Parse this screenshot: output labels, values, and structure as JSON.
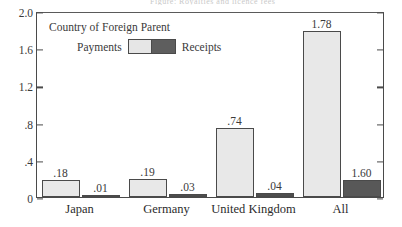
{
  "figure": {
    "ghost_text": "Figure: Royalties and licence fees",
    "plot_title": "Country of Foreign Parent",
    "legend": {
      "left_label": "Payments",
      "right_label": "Receipts",
      "swatch_name": "payments-receipts-swatch"
    }
  },
  "chart_data": {
    "type": "bar",
    "title": "Country of Foreign Parent",
    "xlabel": "",
    "ylabel": "",
    "ylim": [
      0,
      2.0
    ],
    "grid": false,
    "legend_position": "inside-top-left",
    "categories": [
      "Japan",
      "Germany",
      "United Kingdom",
      "All"
    ],
    "series": [
      {
        "name": "Payments",
        "color": "#e8e8e8",
        "values": [
          0.18,
          0.19,
          0.74,
          1.78
        ],
        "labels": [
          ".18",
          ".19",
          ".74",
          "1.78"
        ]
      },
      {
        "name": "Receipts",
        "color": "#585858",
        "values": [
          0.01,
          0.03,
          0.04,
          1.6
        ],
        "labels": [
          ".01",
          ".03",
          ".04",
          "1.60"
        ],
        "drawn_heights": [
          0.01,
          0.03,
          0.04,
          0.18
        ],
        "note": "All/Receipts bar is drawn at ~0.18 height in the original figure although labeled 1.60"
      }
    ],
    "yticks": [
      {
        "value": 2.0,
        "label": "2.0"
      },
      {
        "value": 1.6,
        "label": "1.6"
      },
      {
        "value": 1.2,
        "label": "1.2"
      },
      {
        "value": 0.8,
        "label": ".8"
      },
      {
        "value": 0.4,
        "label": ".4"
      },
      {
        "value": 0.0,
        "label": "0"
      }
    ]
  },
  "colors": {
    "payments": "#e8e8e8",
    "receipts": "#585858",
    "axis": "#4a4a4a",
    "text": "#2b2b2b"
  }
}
